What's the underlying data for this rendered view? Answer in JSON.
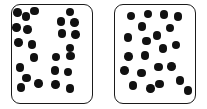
{
  "canvas": {
    "width": 207,
    "height": 109,
    "background": "#ffffff"
  },
  "style": {
    "box_border_color": "#1a1a1a",
    "box_border_width": 1.6,
    "box_corner_radius": 9,
    "box_fill": "#ffffff",
    "dot_color": "#111111",
    "dot_diameter": 8.5
  },
  "panels": [
    {
      "id": "left-panel",
      "label": "left-dot-array",
      "x": 11,
      "y": 4,
      "width": 82,
      "height": 100,
      "dot_count": 24,
      "dots": [
        {
          "cx": 17.5,
          "cy": 12.5
        },
        {
          "cx": 26.0,
          "cy": 16.5
        },
        {
          "cx": 34.5,
          "cy": 11.0
        },
        {
          "cx": 16.5,
          "cy": 27.5
        },
        {
          "cx": 27.5,
          "cy": 29.5
        },
        {
          "cx": 18.5,
          "cy": 42.5
        },
        {
          "cx": 32.0,
          "cy": 44.5
        },
        {
          "cx": 70.0,
          "cy": 12.0
        },
        {
          "cx": 61.0,
          "cy": 21.5
        },
        {
          "cx": 74.5,
          "cy": 22.5
        },
        {
          "cx": 62.0,
          "cy": 33.5
        },
        {
          "cx": 75.5,
          "cy": 34.5
        },
        {
          "cx": 70.0,
          "cy": 48.0
        },
        {
          "cx": 34.0,
          "cy": 57.5
        },
        {
          "cx": 20.0,
          "cy": 67.5
        },
        {
          "cx": 26.5,
          "cy": 78.0
        },
        {
          "cx": 21.0,
          "cy": 87.5
        },
        {
          "cx": 38.5,
          "cy": 83.5
        },
        {
          "cx": 56.0,
          "cy": 57.0
        },
        {
          "cx": 70.5,
          "cy": 56.0
        },
        {
          "cx": 55.0,
          "cy": 70.5
        },
        {
          "cx": 68.0,
          "cy": 72.0
        },
        {
          "cx": 55.5,
          "cy": 84.5
        },
        {
          "cx": 70.0,
          "cy": 88.5
        }
      ]
    },
    {
      "id": "right-panel",
      "label": "right-dot-array",
      "x": 114,
      "y": 4,
      "width": 82,
      "height": 100,
      "dot_count": 22,
      "dots": [
        {
          "cx": 131.0,
          "cy": 16.0
        },
        {
          "cx": 148.0,
          "cy": 14.0
        },
        {
          "cx": 142.0,
          "cy": 26.5
        },
        {
          "cx": 128.0,
          "cy": 37.5
        },
        {
          "cx": 146.5,
          "cy": 41.0
        },
        {
          "cx": 164.0,
          "cy": 14.5
        },
        {
          "cx": 178.0,
          "cy": 16.5
        },
        {
          "cx": 170.0,
          "cy": 28.0
        },
        {
          "cx": 157.0,
          "cy": 35.5
        },
        {
          "cx": 176.0,
          "cy": 45.0
        },
        {
          "cx": 163.0,
          "cy": 48.5
        },
        {
          "cx": 128.5,
          "cy": 56.5
        },
        {
          "cx": 145.0,
          "cy": 55.5
        },
        {
          "cx": 124.5,
          "cy": 70.5
        },
        {
          "cx": 141.5,
          "cy": 73.0
        },
        {
          "cx": 133.0,
          "cy": 85.5
        },
        {
          "cx": 150.5,
          "cy": 88.5
        },
        {
          "cx": 158.5,
          "cy": 67.0
        },
        {
          "cx": 171.5,
          "cy": 66.5
        },
        {
          "cx": 159.5,
          "cy": 84.0
        },
        {
          "cx": 180.0,
          "cy": 80.5
        },
        {
          "cx": 188.0,
          "cy": 90.5
        }
      ]
    }
  ]
}
